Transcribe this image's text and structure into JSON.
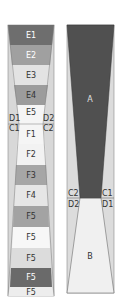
{
  "left_diagram": {
    "segments": [
      {
        "label": "E1",
        "fill": "#6e6e6e",
        "text": "#ffffff"
      },
      {
        "label": "E2",
        "fill": "#a0a0a0",
        "text": "#ffffff"
      },
      {
        "label": "E3",
        "fill": "#e3e3e3",
        "text": "#333333"
      },
      {
        "label": "E4",
        "fill": "#9c9c9c",
        "text": "#333333"
      },
      {
        "label": "E5",
        "fill": "#f5f5f5",
        "text": "#333333"
      },
      {
        "label": "F1",
        "fill": "#f5f5f5",
        "text": "#333333"
      },
      {
        "label": "F2",
        "fill": "#f2f2f2",
        "text": "#333333"
      },
      {
        "label": "F3",
        "fill": "#a6a6a6",
        "text": "#333333"
      },
      {
        "label": "F4",
        "fill": "#e6e6e6",
        "text": "#333333"
      },
      {
        "label": "F5",
        "fill": "#a3a3a3",
        "text": "#333333"
      },
      {
        "label": "F5",
        "fill": "#f7f7f7",
        "text": "#333333"
      },
      {
        "label": "F5",
        "fill": "#dcdcdc",
        "text": "#333333"
      },
      {
        "label": "F5",
        "fill": "#6a6a6a",
        "text": "#ffffff"
      },
      {
        "label": "F5",
        "fill": "#ededed",
        "text": "#333333"
      }
    ],
    "side_labels": {
      "d1": "D1",
      "d2": "D2",
      "c1": "C1",
      "c2": "C2"
    }
  },
  "right_diagram": {
    "region_a": {
      "label": "A",
      "fill": "#505050",
      "text": "#e0e0e0"
    },
    "region_b": {
      "label": "B",
      "fill": "#f0f0f0",
      "text": "#333333"
    },
    "side_labels": {
      "c2": "C2",
      "c1": "C1",
      "d2": "D2",
      "d1": "D1"
    },
    "background": "#dcdcdc"
  }
}
